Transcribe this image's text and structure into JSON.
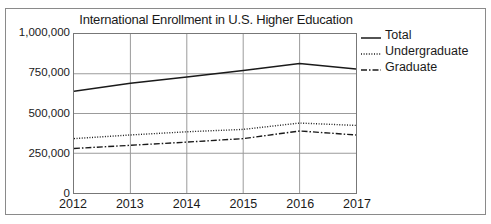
{
  "figure": {
    "title": "International Enrollment in U.S. Higher Education"
  },
  "legend": {
    "items": [
      {
        "label": "Total",
        "style": "solid",
        "icon": "solid-line-icon"
      },
      {
        "label": "Undergraduate",
        "style": "dotted",
        "icon": "dotted-line-icon"
      },
      {
        "label": "Graduate",
        "style": "dashdot",
        "icon": "dash-dot-line-icon"
      }
    ]
  },
  "colors": {
    "line": "#1a1a1a",
    "grid": "#9a9a9a",
    "axis": "#777777",
    "background": "#ffffff",
    "border": "#8a8a8a"
  },
  "chart_data": {
    "type": "line",
    "title": "International Enrollment in U.S. Higher Education",
    "xlabel": "",
    "ylabel": "",
    "x": [
      2012,
      2013,
      2014,
      2015,
      2016,
      2017
    ],
    "categories": [
      "2012",
      "2013",
      "2014",
      "2015",
      "2016",
      "2017"
    ],
    "xtick_labels": [
      "2012",
      "2013",
      "2014",
      "2015",
      "2016",
      "2017"
    ],
    "ytick_labels": [
      "0",
      "250,000",
      "500,000",
      "750,000",
      "1,000,000"
    ],
    "ytick_values": [
      0,
      250000,
      500000,
      750000,
      1000000
    ],
    "ylim": [
      0,
      1000000
    ],
    "xlim": [
      2012,
      2017
    ],
    "grid": true,
    "legend_position": "right",
    "series": [
      {
        "name": "Total",
        "style": "solid",
        "values": [
          640000,
          690000,
          730000,
          770000,
          815000,
          780000
        ]
      },
      {
        "name": "Undergraduate",
        "style": "dotted",
        "values": [
          342000,
          365000,
          385000,
          400000,
          440000,
          425000
        ]
      },
      {
        "name": "Graduate",
        "style": "dashdot",
        "values": [
          280000,
          300000,
          320000,
          342000,
          390000,
          365000
        ]
      }
    ]
  }
}
